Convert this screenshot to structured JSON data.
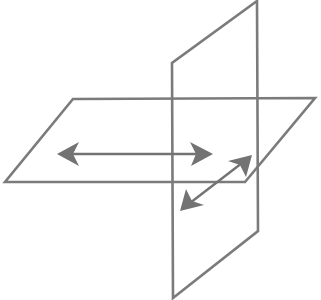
{
  "diagram": {
    "colors": {
      "stroke": "#7b7b7b",
      "arrow": "#737373",
      "background": "#ffffff"
    },
    "horizontal_plane": {
      "points": [
        [
          73,
          99
        ],
        [
          315,
          98
        ],
        [
          245,
          182
        ],
        [
          5,
          182
        ]
      ]
    },
    "vertical_plane": {
      "points": [
        [
          257,
          1
        ],
        [
          258,
          231
        ],
        [
          173,
          298
        ],
        [
          172,
          63
        ]
      ]
    },
    "arrows": [
      {
        "name": "horizontal-double-arrow",
        "from": [
          57,
          154
        ],
        "to": [
          213,
          154
        ]
      },
      {
        "name": "diagonal-double-arrow",
        "from": [
          180,
          211
        ],
        "to": [
          252,
          155
        ]
      }
    ]
  }
}
